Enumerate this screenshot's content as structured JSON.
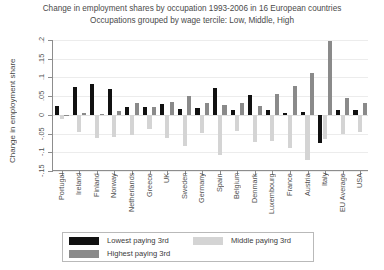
{
  "chart_data": {
    "type": "bar",
    "title": "Change in employment shares by occupation 1993-2006 in 16 European countries",
    "subtitle": "Occupations grouped by wage tercile: Low, Middle, High",
    "xlabel": "",
    "ylabel": "Change in employment share",
    "ylim": [
      -0.15,
      0.2
    ],
    "yticks": [
      -0.15,
      -0.1,
      -0.05,
      0,
      0.05,
      0.1,
      0.15,
      0.2
    ],
    "ytick_labels": [
      "-.15",
      "-.1",
      "-.05",
      "0",
      ".05",
      ".1",
      ".15",
      ".2"
    ],
    "grid": true,
    "legend_position": "bottom",
    "categories": [
      "Portugal",
      "Ireland",
      "Finland",
      "Norway",
      "Netherlands",
      "Greece",
      "UK",
      "Sweden",
      "Germany",
      "Spain",
      "Belgium",
      "Denmark",
      "Luxembourg",
      "France",
      "Austria",
      "Italy",
      "EU Average",
      "USA"
    ],
    "series": [
      {
        "name": "Lowest paying 3rd",
        "color": "#111111",
        "values": [
          0.025,
          0.075,
          0.082,
          0.068,
          0.02,
          0.022,
          0.028,
          0.016,
          0.018,
          0.073,
          0.013,
          0.053,
          0.012,
          0.005,
          0.008,
          -0.075,
          0.012,
          0.014
        ]
      },
      {
        "name": "Middle paying 3rd",
        "color": "#d4d4d4",
        "values": [
          -0.012,
          -0.045,
          -0.062,
          -0.058,
          -0.055,
          -0.038,
          -0.062,
          -0.082,
          -0.048,
          -0.106,
          -0.042,
          -0.073,
          -0.069,
          -0.088,
          -0.12,
          -0.064,
          -0.052,
          -0.047
        ]
      },
      {
        "name": "Highest paying 3rd",
        "color": "#8a8a8a",
        "values": [
          -0.004,
          0.004,
          0.003,
          0.01,
          0.032,
          0.02,
          0.034,
          0.05,
          0.031,
          0.027,
          0.033,
          0.023,
          0.056,
          0.076,
          0.112,
          0.198,
          0.045,
          0.031
        ]
      }
    ]
  },
  "legend": {
    "items": [
      {
        "label": "Lowest paying 3rd",
        "color": "#111111"
      },
      {
        "label": "Middle paying 3rd",
        "color": "#d4d4d4"
      },
      {
        "label": "Highest paying 3rd",
        "color": "#8a8a8a"
      }
    ]
  }
}
